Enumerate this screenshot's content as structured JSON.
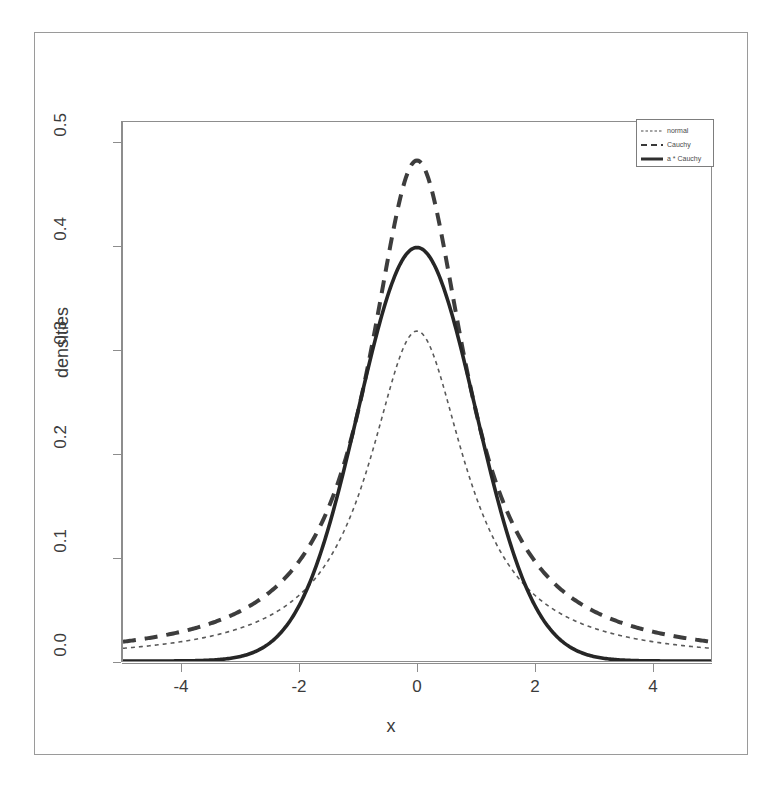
{
  "figure": {
    "axis_titles": {
      "x": "x",
      "y": "densities"
    },
    "x_ticks": [
      "-4",
      "-2",
      "0",
      "2",
      "4"
    ],
    "y_ticks": [
      "0.0",
      "0.1",
      "0.2",
      "0.3",
      "0.4",
      "0.5"
    ],
    "legend": {
      "entries": [
        {
          "label": "normal",
          "key": "thin-dotted-line-key"
        },
        {
          "label": "Cauchy",
          "key": "dashed-line-key"
        },
        {
          "label": "a * Cauchy",
          "key": "thick-solid-line-key"
        }
      ]
    },
    "colors": {
      "ink": "#3a3a3a",
      "axis": "#8d8d8d",
      "border": "#9a9a9a"
    }
  },
  "chart_data": {
    "type": "line",
    "title": "",
    "xlabel": "x",
    "ylabel": "densities",
    "xlim": [
      -5,
      5
    ],
    "ylim": [
      0,
      0.52
    ],
    "grid": false,
    "legend_position": "top-right",
    "xticks": [
      -4,
      -2,
      0,
      2,
      4
    ],
    "yticks": [
      0.0,
      0.1,
      0.2,
      0.3,
      0.4,
      0.5
    ],
    "x": [
      -5.0,
      -4.5,
      -4.0,
      -3.5,
      -3.0,
      -2.5,
      -2.0,
      -1.5,
      -1.0,
      -0.5,
      0.0,
      0.5,
      1.0,
      1.5,
      2.0,
      2.5,
      3.0,
      3.5,
      4.0,
      4.5,
      5.0
    ],
    "series": [
      {
        "name": "normal",
        "style": "solid-thick",
        "peak": 0.3989,
        "values": [
          1.5e-06,
          1.6e-05,
          0.0001338,
          0.0008727,
          0.0044318,
          0.0175283,
          0.053991,
          0.1295176,
          0.2419707,
          0.3520653,
          0.3989423,
          0.3520653,
          0.2419707,
          0.1295176,
          0.053991,
          0.0175283,
          0.0044318,
          0.0008727,
          0.0001338,
          1.6e-05,
          1.5e-06
        ]
      },
      {
        "name": "Cauchy",
        "style": "dotted-thin",
        "peak": 0.3183,
        "values": [
          0.0122,
          0.0149,
          0.0187,
          0.0241,
          0.0318,
          0.0439,
          0.0637,
          0.0979,
          0.1592,
          0.2546,
          0.3183,
          0.2546,
          0.1592,
          0.0979,
          0.0637,
          0.0439,
          0.0318,
          0.0241,
          0.0187,
          0.0149,
          0.0122
        ]
      },
      {
        "name": "a * Cauchy",
        "style": "dashed-thick",
        "peak": 0.4829,
        "values": [
          0.0185,
          0.0226,
          0.0284,
          0.0366,
          0.0483,
          0.0666,
          0.0966,
          0.1486,
          0.2415,
          0.3863,
          0.4829,
          0.3863,
          0.2415,
          0.1486,
          0.0966,
          0.0666,
          0.0483,
          0.0366,
          0.0284,
          0.0226,
          0.0185
        ]
      }
    ]
  }
}
